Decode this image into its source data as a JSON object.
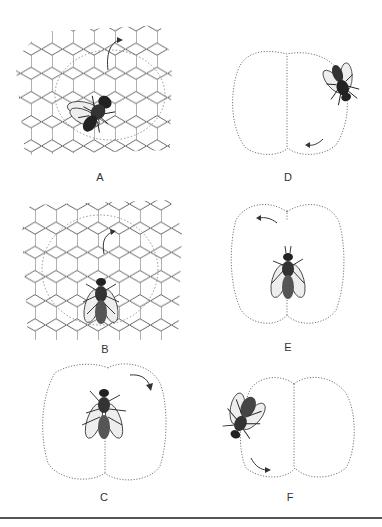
{
  "figure": {
    "panels": [
      {
        "id": "A",
        "label": "A",
        "surface": "honeycomb",
        "path": "dotted-circle",
        "arrow": "up-right"
      },
      {
        "id": "B",
        "label": "B",
        "surface": "honeycomb",
        "path": "dotted-circle",
        "arrow": "up-right"
      },
      {
        "id": "C",
        "label": "C",
        "surface": "figure-eight-vertical",
        "path": "dotted",
        "arrow": "clockwise-right"
      },
      {
        "id": "D",
        "label": "D",
        "surface": "figure-eight-horizontal",
        "path": "dotted",
        "arrow": "bottom-left"
      },
      {
        "id": "E",
        "label": "E",
        "surface": "figure-eight-vertical",
        "path": "dotted",
        "arrow": "top-left"
      },
      {
        "id": "F",
        "label": "F",
        "surface": "figure-eight-horizontal",
        "path": "dotted",
        "arrow": "bottom-right"
      }
    ],
    "colors": {
      "ink": "#333333",
      "dots": "#777777",
      "rule": "#555555",
      "background": "#ffffff"
    }
  }
}
